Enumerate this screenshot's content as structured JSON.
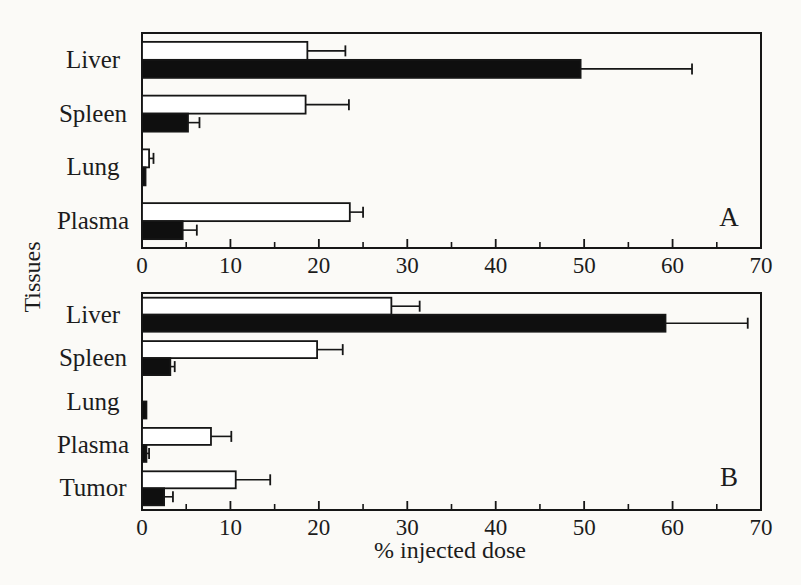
{
  "figure": {
    "background": "#fbfaf7",
    "ink": "#161616",
    "ylabel": "Tissues",
    "xlabel": "% injected dose"
  },
  "chart_data": [
    {
      "type": "bar",
      "orientation": "horizontal",
      "panel_label": "A",
      "xlabel": "% injected dose",
      "ylabel": "Tissues",
      "xlim": [
        0,
        70
      ],
      "xticks_major": [
        0,
        10,
        20,
        30,
        40,
        50,
        60,
        70
      ],
      "xticks_minor": [
        5,
        15,
        25,
        35,
        45,
        55,
        65
      ],
      "grid": false,
      "legend": false,
      "bar_style_note": "each tissue has an open (white) bar on top and a solid (black) bar below, with one-sided plus error whiskers",
      "categories": [
        "Liver",
        "Spleen",
        "Lung",
        "Plasma"
      ],
      "series": [
        {
          "name": "open-bars",
          "fill": "#ffffff",
          "values": [
            18.7,
            18.5,
            0.8,
            23.5
          ],
          "errors_plus": [
            4.3,
            4.9,
            0.5,
            1.5
          ]
        },
        {
          "name": "solid-bars",
          "fill": "#0f0f0f",
          "values": [
            49.6,
            5.2,
            0.4,
            4.6
          ],
          "errors_plus": [
            12.6,
            1.3,
            0,
            1.6
          ]
        }
      ]
    },
    {
      "type": "bar",
      "orientation": "horizontal",
      "panel_label": "B",
      "xlabel": "% injected dose",
      "ylabel": "Tissues",
      "xlim": [
        0,
        70
      ],
      "xticks_major": [
        0,
        10,
        20,
        30,
        40,
        50,
        60,
        70
      ],
      "xticks_minor": [
        5,
        15,
        25,
        35,
        45,
        55,
        65
      ],
      "grid": false,
      "legend": false,
      "bar_style_note": "each tissue has an open (white) bar on top and a solid (black) bar below, with one-sided plus error whiskers",
      "categories": [
        "Liver",
        "Spleen",
        "Lung",
        "Plasma",
        "Tumor"
      ],
      "series": [
        {
          "name": "open-bars",
          "fill": "#ffffff",
          "values": [
            28.2,
            19.8,
            0,
            7.8,
            10.6
          ],
          "errors_plus": [
            3.2,
            2.9,
            0,
            2.3,
            3.9
          ]
        },
        {
          "name": "solid-bars",
          "fill": "#0f0f0f",
          "values": [
            59.2,
            3.2,
            0.5,
            0.5,
            2.5
          ],
          "errors_plus": [
            9.3,
            0.5,
            0,
            0.3,
            1.0
          ]
        }
      ]
    }
  ]
}
